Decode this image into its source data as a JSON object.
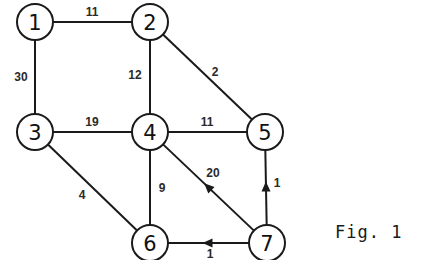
{
  "figure": {
    "caption": "Fig. 1",
    "colors": {
      "stroke": "#1a1a1a",
      "background": "#ffffff",
      "text": "#111111"
    }
  },
  "nodes": [
    {
      "id": "1",
      "label": "1",
      "x": 35,
      "y": 22
    },
    {
      "id": "2",
      "label": "2",
      "x": 150,
      "y": 22
    },
    {
      "id": "3",
      "label": "3",
      "x": 35,
      "y": 132
    },
    {
      "id": "4",
      "label": "4",
      "x": 150,
      "y": 132
    },
    {
      "id": "5",
      "label": "5",
      "x": 265,
      "y": 132
    },
    {
      "id": "6",
      "label": "6",
      "x": 150,
      "y": 243
    },
    {
      "id": "7",
      "label": "7",
      "x": 267,
      "y": 243
    }
  ],
  "edges": [
    {
      "from": "1",
      "to": "2",
      "weight": "11",
      "directed": false,
      "label_x": 92,
      "label_y": 12
    },
    {
      "from": "1",
      "to": "3",
      "weight": "30",
      "directed": false,
      "label_x": 21,
      "label_y": 77
    },
    {
      "from": "2",
      "to": "4",
      "weight": "12",
      "directed": false,
      "label_x": 135,
      "label_y": 75
    },
    {
      "from": "2",
      "to": "5",
      "weight": "2",
      "directed": false,
      "label_x": 215,
      "label_y": 72
    },
    {
      "from": "3",
      "to": "4",
      "weight": "19",
      "directed": false,
      "label_x": 92,
      "label_y": 122
    },
    {
      "from": "4",
      "to": "5",
      "weight": "11",
      "directed": false,
      "label_x": 207,
      "label_y": 122
    },
    {
      "from": "3",
      "to": "6",
      "weight": "4",
      "directed": false,
      "label_x": 82,
      "label_y": 195
    },
    {
      "from": "4",
      "to": "6",
      "weight": "9",
      "directed": false,
      "label_x": 162,
      "label_y": 188
    },
    {
      "from": "7",
      "to": "4",
      "weight": "20",
      "directed": true,
      "label_x": 213,
      "label_y": 173
    },
    {
      "from": "7",
      "to": "5",
      "weight": "1",
      "directed": true,
      "label_x": 277,
      "label_y": 183
    },
    {
      "from": "7",
      "to": "6",
      "weight": "1",
      "directed": true,
      "label_x": 210,
      "label_y": 254
    }
  ]
}
